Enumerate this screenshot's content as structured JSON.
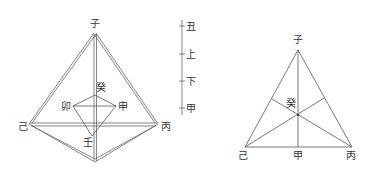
{
  "left_figure": {
    "apex_label": "子",
    "left_label": "己",
    "right_label": "丙",
    "inner_top_label": "癸",
    "inner_left_label": "卯",
    "inner_right_label": "申",
    "inner_bottom_label": "壬"
  },
  "scale_bar": {
    "ticks": [
      "丑",
      "上",
      "下",
      "甲"
    ]
  },
  "right_figure": {
    "apex_label": "子",
    "left_label": "己",
    "right_label": "丙",
    "bottom_mid_label": "甲",
    "center_label": "癸"
  },
  "colors": {
    "line": "#555555",
    "text": "#333333",
    "background": "#ffffff"
  }
}
